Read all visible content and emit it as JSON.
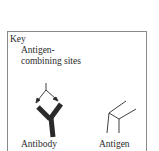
{
  "key": {
    "title": "Key",
    "sites_label": "Antigen-combining sites",
    "antibody_label": "Antibody",
    "antigen_label": "Antigen"
  },
  "icons": {
    "antibody": "antibody-y-shape",
    "antigen": "antigen-wireframe",
    "arrows": "pointer-arrows"
  }
}
